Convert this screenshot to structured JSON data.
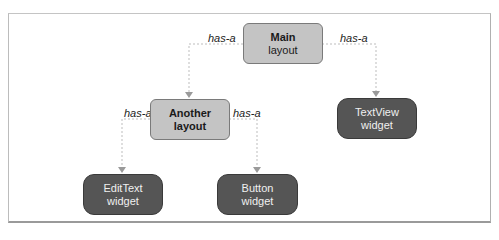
{
  "diagram": {
    "nodes": [
      {
        "id": "main",
        "line1": "Main",
        "line2": "layout",
        "kind": "layout"
      },
      {
        "id": "another",
        "line1": "Another",
        "line2": "layout",
        "kind": "layout"
      },
      {
        "id": "textview",
        "line1": "TextView",
        "line2": "widget",
        "kind": "widget"
      },
      {
        "id": "edittext",
        "line1": "EditText",
        "line2": "widget",
        "kind": "widget"
      },
      {
        "id": "button",
        "line1": "Button",
        "line2": "widget",
        "kind": "widget"
      }
    ],
    "edges": [
      {
        "from": "main",
        "to": "another",
        "label": "has-a"
      },
      {
        "from": "main",
        "to": "textview",
        "label": "has-a"
      },
      {
        "from": "another",
        "to": "edittext",
        "label": "has-a"
      },
      {
        "from": "another",
        "to": "button",
        "label": "has-a"
      }
    ],
    "colors": {
      "layout_fill": "#c4c4c4",
      "widget_fill": "#555555",
      "edge": "#b8b8b8",
      "arrow": "#9a9a9a"
    }
  }
}
